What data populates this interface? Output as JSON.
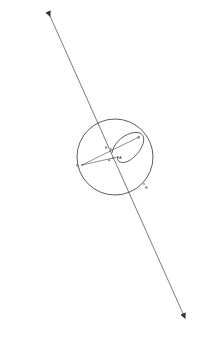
{
  "diagram": {
    "stroke_color": "#333333",
    "points": {
      "A": {
        "label": "A",
        "x": 119,
        "y": 157
      },
      "B": {
        "label": "B",
        "x": 147,
        "y": 187
      },
      "C": {
        "label": "C",
        "x": 139,
        "y": 137
      },
      "D": {
        "label": "D",
        "x": 80,
        "y": 165
      },
      "E": {
        "label": "E",
        "x": 107,
        "y": 147
      },
      "F": {
        "label": "F",
        "x": 110,
        "y": 161
      }
    }
  }
}
